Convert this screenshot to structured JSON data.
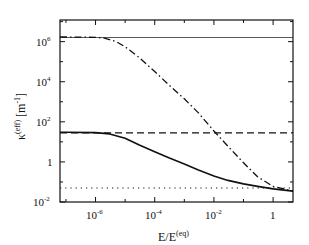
{
  "chart_data": {
    "type": "line",
    "title": "",
    "xlabel": "E/E(eq)",
    "ylabel": "κ(eff) [m-1]",
    "xscale": "log",
    "yscale": "log",
    "xlim": [
      6.3e-08,
      4.7
    ],
    "ylim": [
      0.01,
      12000000.0
    ],
    "grid": false,
    "legend": null,
    "x_ticks": [
      {
        "exp": "-6",
        "value": 1e-06
      },
      {
        "exp": "-4",
        "value": 0.0001
      },
      {
        "exp": "-2",
        "value": 0.01
      },
      {
        "exp": "",
        "value": 1,
        "label": "1"
      }
    ],
    "y_ticks": [
      {
        "exp": "6",
        "value": 1000000.0
      },
      {
        "exp": "4",
        "value": 10000.0
      },
      {
        "exp": "2",
        "value": 100.0
      },
      {
        "exp": "",
        "value": 1,
        "label": "1"
      },
      {
        "exp": "-2",
        "value": 0.01
      }
    ],
    "series": [
      {
        "name": "thin-solid-constant",
        "style": "thin solid",
        "x": [
          6.3e-08,
          4.7
        ],
        "y": [
          1600000.0,
          1600000.0
        ]
      },
      {
        "name": "dash-dot",
        "style": "dash-dot",
        "x": [
          6.3e-08,
          1e-07,
          1e-06,
          2e-06,
          5e-06,
          1e-05,
          3e-05,
          0.0001,
          0.0003,
          0.001,
          0.003,
          0.01,
          0.03,
          0.1,
          0.3,
          1,
          4.7
        ],
        "y": [
          1700000.0,
          1700000.0,
          1650000.0,
          1500000.0,
          1000000.0,
          550000.0,
          160000.0,
          32000.0,
          7000,
          1400,
          280,
          35,
          6,
          0.9,
          0.18,
          0.06,
          0.035
        ]
      },
      {
        "name": "dashed-constant",
        "style": "dashed",
        "x": [
          6.3e-08,
          4.7
        ],
        "y": [
          28,
          28
        ]
      },
      {
        "name": "solid",
        "style": "solid",
        "x": [
          6.3e-08,
          1e-07,
          1e-06,
          3e-06,
          1e-05,
          3e-05,
          0.0001,
          0.0003,
          0.001,
          0.003,
          0.01,
          0.03,
          0.1,
          0.3,
          1,
          4.7
        ],
        "y": [
          30,
          30,
          29,
          25,
          15,
          7,
          3.2,
          1.6,
          0.8,
          0.4,
          0.2,
          0.12,
          0.08,
          0.06,
          0.045,
          0.035
        ]
      },
      {
        "name": "dotted-constant",
        "style": "dotted",
        "x": [
          6.3e-08,
          4.7
        ],
        "y": [
          0.05,
          0.05
        ]
      }
    ]
  },
  "axes": {
    "x_label_main": "E/E",
    "x_label_sup": "(eq)",
    "y_label_main": "κ",
    "y_label_sup": "(eff)",
    "y_label_units": "[m",
    "y_label_units_sup": "-1",
    "y_label_units_close": "]",
    "tick_base": "10",
    "tick_one": "1"
  }
}
